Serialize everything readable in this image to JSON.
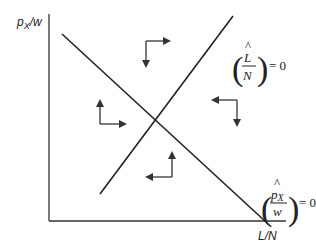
{
  "diagram": {
    "y_axis_label": "p",
    "y_axis_label_sub": "X",
    "y_axis_label_rest": "/w",
    "x_axis_label": "L/N",
    "curves": [
      {
        "name": "L-hat over N equals zero",
        "label_numerator": "L",
        "label_denominator": "N",
        "hat": "^",
        "equals": "= 0",
        "slope": "positive"
      },
      {
        "name": "p_X-hat over w equals zero",
        "label_numerator": "p",
        "label_numerator_sub": "X",
        "label_denominator": "w",
        "hat": "^",
        "equals": "= 0",
        "slope": "negative"
      }
    ],
    "direction_arrows": [
      {
        "region": "top",
        "horizontal": "right",
        "vertical": "down"
      },
      {
        "region": "left",
        "horizontal": "right",
        "vertical": "up"
      },
      {
        "region": "right",
        "horizontal": "left",
        "vertical": "down"
      },
      {
        "region": "bottom",
        "horizontal": "left",
        "vertical": "up"
      }
    ],
    "colors": {
      "line": "#222222",
      "background": "#ffffff"
    }
  }
}
